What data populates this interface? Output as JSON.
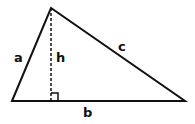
{
  "diagram": {
    "type": "triangle-with-height",
    "vertices": {
      "left": [
        12,
        101
      ],
      "apex": [
        51,
        8
      ],
      "right": [
        185,
        101
      ]
    },
    "height_foot": [
      51,
      101
    ],
    "labels": {
      "a": "a",
      "b": "b",
      "c": "c",
      "h": "h"
    },
    "colors": {
      "stroke": "#111111",
      "background": "#ffffff"
    }
  }
}
